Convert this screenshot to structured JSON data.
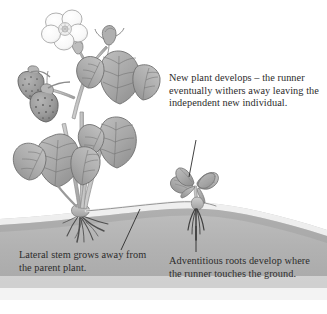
{
  "figure": {
    "background_color": "#ffffff",
    "text_color": "#2c2c2c"
  },
  "captions": {
    "new_plant": "New plant develops – the runner eventually withers away leaving the independent new individual.",
    "lateral_stem": "Lateral stem grows away from the parent plant.",
    "adventitious_roots": "Adventitious roots develop where the runner touches the ground."
  },
  "illustration": {
    "ground_label": "soil-ground",
    "ground_fill_top": "#b6b6b6",
    "ground_fill_bottom": "#9e9e9e",
    "ground_highlight": "#f2f2f2",
    "foliage_fill": "#a8a8a8",
    "foliage_outline": "#6f6f6f",
    "stem_fill": "#c4c4c4",
    "stem_outline": "#8a8a8a",
    "fruit_fill": "#9b9b9b",
    "fruit_outline": "#5f5f5f",
    "flower_fill": "#fbfbfb",
    "flower_outline": "#9a9a9a",
    "root_color": "#4a4a4a",
    "runner_color": "#8d8d8d",
    "leader_line_color": "#2b2b2b",
    "parts": [
      "parent-strawberry-plant",
      "strawberry-flower",
      "flower-bud",
      "strawberry-fruit-upper",
      "strawberry-fruit-lower",
      "trifoliate-leaf-left",
      "trifoliate-leaf-upper-right",
      "trifoliate-leaf-lower-right",
      "parent-plant-roots",
      "runner-stolon",
      "daughter-plantlet",
      "adventitious-roots"
    ]
  }
}
